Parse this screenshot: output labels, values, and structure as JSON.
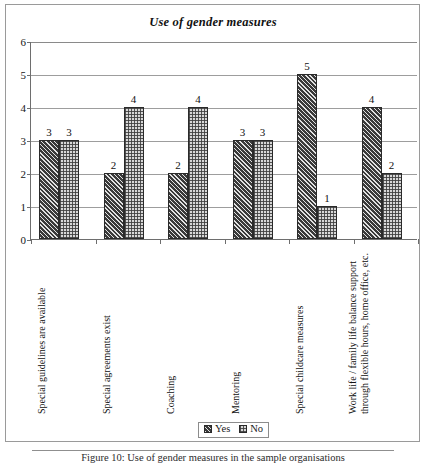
{
  "figure": {
    "title": "Use of gender measures",
    "caption": "Figure 10: Use of gender measures in the sample organisations"
  },
  "legend": {
    "position": "bottom-center",
    "items": [
      {
        "label": "Yes",
        "swatch": "dark-diagonal-hatch",
        "color": "#3a3a3a"
      },
      {
        "label": "No",
        "swatch": "light-checker",
        "color": "#d8d8d8"
      }
    ]
  },
  "yaxis": {
    "ticks": [
      "0",
      "1",
      "2",
      "3",
      "4",
      "5",
      "6"
    ]
  },
  "chart_data": {
    "type": "bar",
    "title": "Use of gender measures",
    "xlabel": "",
    "ylabel": "",
    "ylim": [
      0,
      6
    ],
    "ytick_step": 1,
    "grid": true,
    "legend_position": "bottom-center",
    "categories": [
      "Special guidelines are available",
      "Special agreements exist",
      "Coaching",
      "Mentoring",
      "Special childcare measures",
      "Work life / family life balance support through flexible hours, home office, etc."
    ],
    "category_lines": [
      [
        "Special guidelines are available"
      ],
      [
        "Special agreements exist"
      ],
      [
        "Coaching"
      ],
      [
        "Mentoring"
      ],
      [
        "Special childcare measures"
      ],
      [
        "Work life / family life balance support",
        "through flexible hours, home office, etc."
      ]
    ],
    "series": [
      {
        "name": "Yes",
        "values": [
          3,
          2,
          2,
          3,
          5,
          4
        ]
      },
      {
        "name": "No",
        "values": [
          3,
          4,
          4,
          3,
          1,
          2
        ]
      }
    ]
  }
}
